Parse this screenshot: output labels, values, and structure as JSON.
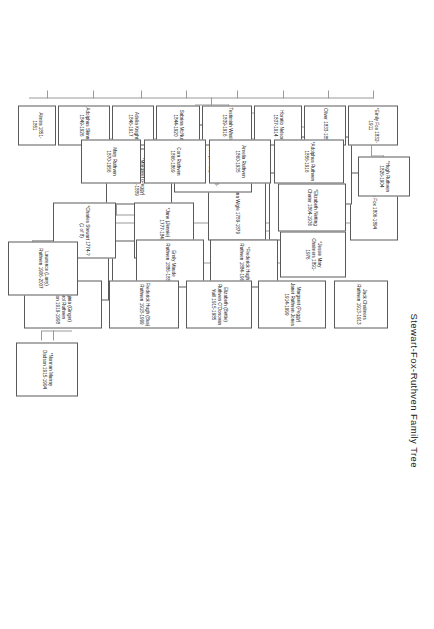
{
  "document": {
    "title": "Stewart-Fox-Ruthven Family Tree",
    "orientation": "landscape-content-rotated-90",
    "page_background": "#ffffff",
    "box_border_color": "#5a5a5a",
    "connector_color": "#9a9a9a",
    "note": "An asterisk (*) prefix marks direct-line ancestors."
  },
  "nodes": [
    {
      "id": "philip-fox",
      "text": "*Philip Fox 1806-1894"
    },
    {
      "id": "george-fox",
      "text": "*George Fox 1781-1838 (1 of 10)"
    },
    {
      "id": "catherine-lamer-fox",
      "text": "*Catherine Lamer Fox"
    },
    {
      "id": "julianna-wigle",
      "text": "*Julianna Wigle 1789-1879"
    },
    {
      "id": "michael-george-fox",
      "text": "*Michael George Fox 1806-1894 (1 of 12)"
    },
    {
      "id": "margaret-peggy-stewart",
      "text": "*Margaret (Peggy) Stewart 1811-1889"
    },
    {
      "id": "james-stewart",
      "text": "*James Stewart 1730-1779"
    },
    {
      "id": "margaret-russell-brown-stewart",
      "text": "*Margaret Russell Brown Stewart 1731-1838"
    },
    {
      "id": "jane-jennie-findlay",
      "text": "*Jane (Jennie) Findlay 1777-1840"
    },
    {
      "id": "charles-stewart",
      "text": "*Charles Stewart 1774-? (1 of 8)"
    },
    {
      "id": "emily-fox",
      "text": "*Emily Fox 1832-1911"
    },
    {
      "id": "oliver",
      "text": "Oliver 1833-1854"
    },
    {
      "id": "horatio-nelson",
      "text": "Horatio Nelson 1837-1914"
    },
    {
      "id": "testimiah-whaley",
      "text": "Testimiah Whaley 1839-1916"
    },
    {
      "id": "sabrina-mcnutt",
      "text": "Sabrina McNutt 1844-1920"
    },
    {
      "id": "adelia-knight",
      "text": "Adelia Knight 1846-1917"
    },
    {
      "id": "adolphus-skinner",
      "text": "Adolphus Skinner 1849-1926"
    },
    {
      "id": "almira",
      "text": "Almira 1851-1851"
    },
    {
      "id": "hugh-ruthven",
      "text": "*Hugh Ruthven 1826-1904"
    },
    {
      "id": "adolphus-ruthven",
      "text": "*Adolphus Ruthven 1856-1916"
    },
    {
      "id": "amelia-ruthven",
      "text": "Amelia Ruthven 1860-1935"
    },
    {
      "id": "cora-ruthven",
      "text": "Cora Ruthven 1866-1869"
    },
    {
      "id": "mary-ruthven",
      "text": "Mary Ruthven 1870-1956"
    },
    {
      "id": "elizabeth-netting-chater",
      "text": "*Elizabeth Netting Chater 1864-1936"
    },
    {
      "id": "frederick-hugh-ruthven",
      "text": "*Frederick Hugh Ruthven 1884-1966"
    },
    {
      "id": "emily-maude-ruthven",
      "text": "Emily Maude Ruthven 1886-1886"
    },
    {
      "id": "jessie-mary-chalmers",
      "text": "*Jessie Mary Chalmers 1891-1976"
    },
    {
      "id": "jack-chalmers-ruthven",
      "text": "Jack Chalmers Ruthven 1913-1913"
    },
    {
      "id": "margaret-peggy-jones",
      "text": "Margaret (Peggy) Janet Ruthven Jones 1914-1999"
    },
    {
      "id": "elizabeth-bettie-yuill",
      "text": "Elizabeth (Bettie) Ruthven O'Donovan Yuill 1915-1985"
    },
    {
      "id": "frederick-hugh-bus-ruthven",
      "text": "Frederick Hugh (Bus) Ruthven 1918-1999"
    },
    {
      "id": "virginia-ginger-dadson",
      "text": "*Virginia (Ginger) Carol Ruthven Dadson 1919-1998"
    },
    {
      "id": "lawrence-larry-ruthven",
      "text": "Lawrence (Larry) Ruthven 1906-2007"
    },
    {
      "id": "norman-murray-dadson",
      "text": "*Norman Murray Dadson 1915-1994"
    }
  ]
}
